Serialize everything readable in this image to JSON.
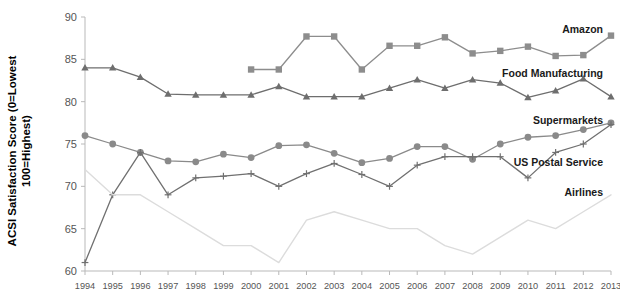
{
  "axes": {
    "ylabel_line1": "ACSI Satisfaction Score (0=Lowest",
    "ylabel_line2": "100=Highest)",
    "y_ticks": [
      "60",
      "65",
      "70",
      "75",
      "80",
      "85",
      "90"
    ],
    "x_ticks": [
      "1994",
      "1995",
      "1996",
      "1997",
      "1998",
      "1999",
      "2000",
      "2001",
      "2002",
      "2003",
      "2004",
      "2005",
      "2006",
      "2007",
      "2008",
      "2009",
      "2010",
      "2011",
      "2012",
      "2013"
    ]
  },
  "labels": {
    "amazon": "Amazon",
    "food_manufacturing": "Food Manufacturing",
    "supermarkets": "Supermarkets",
    "usps": "US Postal Service",
    "airlines": "Airlines"
  },
  "colors": {
    "amazon": "#8d8d8d",
    "food_manufacturing": "#6e6e6e",
    "supermarkets": "#8a8a8a",
    "usps": "#707070",
    "airlines": "#dcdcdc",
    "axis": "#b9b9b9",
    "tick_text": "#555555"
  },
  "chart_data": {
    "type": "line",
    "title": "",
    "xlabel": "",
    "ylabel": "ACSI Satisfaction Score (0=Lowest 100=Highest)",
    "ylim": [
      60,
      90
    ],
    "ytick_step": 5,
    "grid": false,
    "legend": "inline-right-annotations",
    "x": [
      1994,
      1995,
      1996,
      1997,
      1998,
      1999,
      2000,
      2001,
      2002,
      2003,
      2004,
      2005,
      2006,
      2007,
      2008,
      2009,
      2010,
      2011,
      2012,
      2013
    ],
    "series": [
      {
        "name": "Amazon",
        "marker": "square",
        "color": "#8d8d8d",
        "x": [
          2000,
          2001,
          2002,
          2003,
          2004,
          2005,
          2006,
          2007,
          2008,
          2009,
          2010,
          2011,
          2012,
          2013
        ],
        "values": [
          83.8,
          83.8,
          87.7,
          87.7,
          83.8,
          86.6,
          86.6,
          87.6,
          85.7,
          86.0,
          86.5,
          85.4,
          85.5,
          87.8
        ]
      },
      {
        "name": "Food Manufacturing",
        "marker": "triangle",
        "color": "#6e6e6e",
        "x": [
          1994,
          1995,
          1996,
          1997,
          1998,
          1999,
          2000,
          2001,
          2002,
          2003,
          2004,
          2005,
          2006,
          2007,
          2008,
          2009,
          2010,
          2011,
          2012,
          2013
        ],
        "values": [
          84.0,
          84.0,
          82.9,
          80.9,
          80.8,
          80.8,
          80.8,
          81.8,
          80.6,
          80.6,
          80.6,
          81.6,
          82.6,
          81.6,
          82.6,
          82.2,
          80.5,
          81.3,
          82.7,
          80.6
        ]
      },
      {
        "name": "Supermarkets",
        "marker": "circle",
        "color": "#8a8a8a",
        "x": [
          1994,
          1995,
          1996,
          1997,
          1998,
          1999,
          2000,
          2001,
          2002,
          2003,
          2004,
          2005,
          2006,
          2007,
          2008,
          2009,
          2010,
          2011,
          2012,
          2013
        ],
        "values": [
          76.0,
          75.0,
          74.0,
          73.0,
          72.9,
          73.8,
          73.4,
          74.8,
          74.9,
          73.9,
          72.8,
          73.3,
          74.7,
          74.7,
          73.2,
          75.0,
          75.8,
          76.0,
          76.7,
          77.5
        ]
      },
      {
        "name": "US Postal Service",
        "marker": "plus",
        "color": "#707070",
        "x": [
          1994,
          1995,
          1996,
          1997,
          1998,
          1999,
          2000,
          2001,
          2002,
          2003,
          2004,
          2005,
          2006,
          2007,
          2008,
          2009,
          2010,
          2011,
          2012,
          2013
        ],
        "values": [
          61.0,
          69.0,
          74.0,
          69.0,
          71.0,
          71.2,
          71.5,
          70.0,
          71.5,
          72.7,
          71.4,
          70.0,
          72.5,
          73.5,
          73.5,
          73.5,
          71.0,
          74.0,
          75.0,
          77.3
        ]
      },
      {
        "name": "Airlines",
        "marker": "none",
        "color": "#dcdcdc",
        "x": [
          1994,
          1995,
          1996,
          1997,
          1998,
          1999,
          2000,
          2001,
          2002,
          2003,
          2004,
          2005,
          2006,
          2007,
          2008,
          2009,
          2010,
          2011,
          2012,
          2013
        ],
        "values": [
          72.0,
          69.0,
          69.0,
          67.0,
          65.0,
          63.0,
          63.0,
          61.0,
          66.0,
          67.0,
          66.0,
          65.0,
          65.0,
          63.0,
          62.0,
          64.0,
          66.0,
          65.0,
          67.0,
          69.0
        ]
      }
    ]
  }
}
